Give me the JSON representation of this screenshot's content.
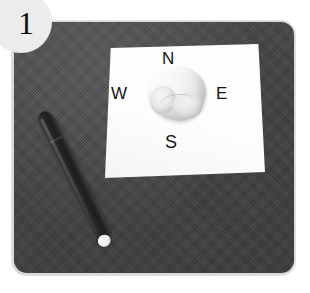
{
  "figure": {
    "step_badge": {
      "label": "1",
      "shape": "circle",
      "background_color": "#ececec",
      "text_color": "#101010"
    },
    "background_color": "#ffffff"
  },
  "mat": {
    "name": "work-mat",
    "description": "dark gray woven fabric mat with rounded corners",
    "color": "#3f3f3f",
    "edge_color": "#d8d8d8",
    "texture": "woven-canvas"
  },
  "paper": {
    "name": "compass-sheet",
    "description": "white paper sheet labelled with compass directions",
    "color": "#fdfdfd"
  },
  "compass": {
    "labels": [
      {
        "key": "north",
        "text": "N"
      },
      {
        "key": "west",
        "text": "W"
      },
      {
        "key": "east",
        "text": "E"
      },
      {
        "key": "south",
        "text": "S"
      }
    ],
    "text_color": "#141414"
  },
  "clay": {
    "name": "clay-blob",
    "description": "irregular lump of light gray modelling clay",
    "color": "#eeeeee"
  },
  "pen": {
    "name": "marker-pen",
    "description": "dark gray marker pen lying diagonally on the mat",
    "barrel_color": "#262626",
    "tip_color": "#f5f5f5"
  }
}
